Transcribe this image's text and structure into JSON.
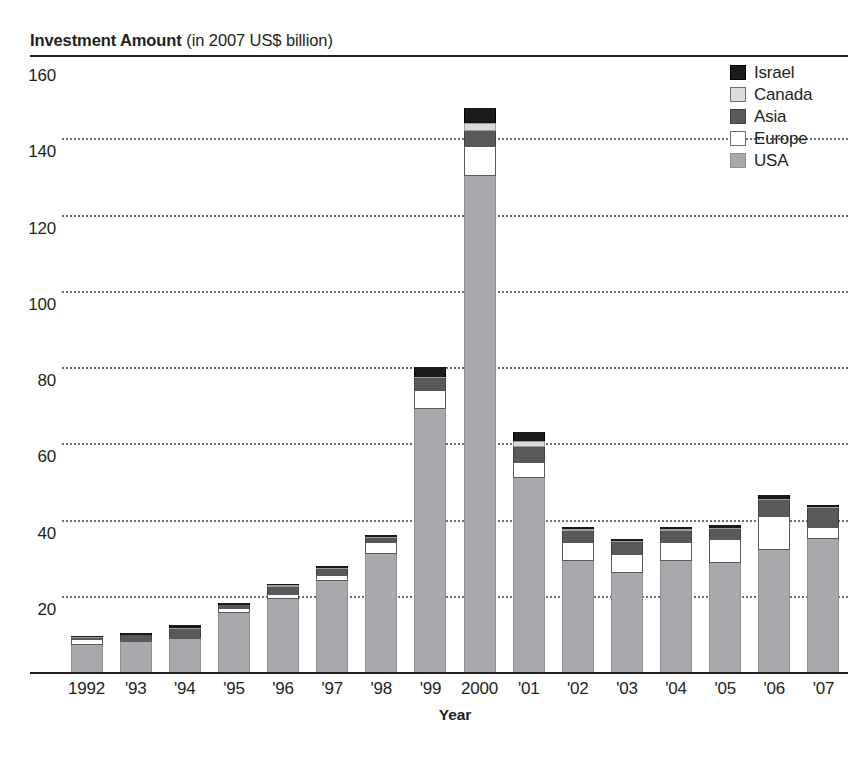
{
  "chart_data": {
    "type": "bar",
    "stacked": true,
    "title": "Investment Amount",
    "title_suffix": "(in 2007 US$ billion)",
    "xlabel": "Year",
    "ylabel": "",
    "ylim": [
      0,
      160
    ],
    "yticks": [
      160,
      140,
      120,
      100,
      80,
      60,
      40,
      20
    ],
    "grid": "horizontal-dotted",
    "legend_position": "top-right",
    "categories": [
      "1992",
      "'93",
      "'94",
      "'95",
      "'96",
      "'97",
      "'98",
      "'99",
      "2000",
      "'01",
      "'02",
      "'03",
      "'04",
      "'05",
      "'06",
      "'07"
    ],
    "series": [
      {
        "name": "USA",
        "color": "#a7a9ac",
        "values": [
          7.2,
          8.0,
          8.6,
          15.6,
          19.2,
          24.0,
          31.0,
          69.0,
          130.0,
          51.0,
          29.0,
          26.0,
          29.0,
          28.5,
          32.0,
          35.0
        ]
      },
      {
        "name": "Europe",
        "color": "#ffffff",
        "values": [
          1.4,
          0.4,
          0.7,
          1.2,
          1.2,
          1.4,
          3.0,
          5.0,
          8.0,
          4.0,
          5.0,
          5.0,
          5.0,
          6.5,
          9.0,
          3.0
        ]
      },
      {
        "name": "Asia",
        "color": "#58595b",
        "values": [
          0.3,
          1.2,
          2.0,
          0.7,
          2.0,
          1.6,
          1.2,
          3.0,
          4.0,
          4.0,
          3.0,
          3.0,
          3.0,
          2.5,
          4.0,
          5.0
        ]
      },
      {
        "name": "Canada",
        "color": "#d9dadb",
        "values": [
          0.2,
          0.2,
          0.2,
          0.2,
          0.3,
          0.3,
          0.3,
          0.5,
          2.0,
          1.5,
          0.4,
          0.4,
          0.4,
          0.4,
          0.5,
          0.4
        ]
      },
      {
        "name": "Israel",
        "color": "#1a1a1a",
        "values": [
          0.1,
          0.2,
          0.8,
          0.3,
          0.3,
          0.3,
          0.5,
          2.5,
          4.0,
          2.5,
          0.6,
          0.6,
          0.6,
          0.6,
          1.0,
          0.5
        ]
      }
    ],
    "totals": [
      9.2,
      10.0,
      12.3,
      18.0,
      23.0,
      27.6,
      36.0,
      80.0,
      148.0,
      63.0,
      38.0,
      35.0,
      38.0,
      38.5,
      46.5,
      43.9
    ]
  },
  "legend": {
    "items": [
      {
        "label": "Israel",
        "key": "israel"
      },
      {
        "label": "Canada",
        "key": "canada"
      },
      {
        "label": "Asia",
        "key": "asia"
      },
      {
        "label": "Europe",
        "key": "europe"
      },
      {
        "label": "USA",
        "key": "usa"
      }
    ]
  }
}
